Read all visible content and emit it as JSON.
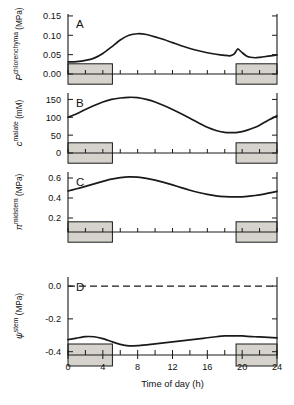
{
  "figure": {
    "x_axis": {
      "title": "Time of day  (h)",
      "ticks": [
        0,
        4,
        8,
        12,
        16,
        20,
        24
      ],
      "tick_labels": [
        "0",
        "4",
        "8",
        "12",
        "16",
        "20",
        "24"
      ],
      "range": [
        0,
        24
      ],
      "minor_tick_interval": 2
    },
    "night_bars": [
      {
        "start": 0,
        "end": 5.1
      },
      {
        "start": 19.3,
        "end": 24
      }
    ],
    "panels": [
      {
        "letter": "A",
        "ylabel_symbol": "P",
        "ylabel_superscript": "chlorenchyma",
        "ylabel_unit": "(MPa)",
        "ylabel_italic": true,
        "ticks": [
          0.0,
          0.05,
          0.1,
          0.15
        ],
        "tick_labels": [
          "0.00",
          "0.05",
          "0.10",
          "0.15"
        ],
        "ylim": [
          0.0,
          0.155
        ]
      },
      {
        "letter": "B",
        "ylabel_symbol": "c",
        "ylabel_superscript": "malate",
        "ylabel_unit": "(mM)",
        "ylabel_italic": true,
        "ticks": [
          0,
          50,
          100,
          150
        ],
        "tick_labels": [
          "0",
          "50",
          "100",
          "150"
        ],
        "ylim": [
          0,
          168
        ]
      },
      {
        "letter": "C",
        "ylabel_symbol": "π",
        "ylabel_superscript": "midstem",
        "ylabel_unit": "(MPa)",
        "ylabel_italic": true,
        "ticks": [
          0.2,
          0.4,
          0.6
        ],
        "tick_labels": [
          "0.2",
          "0.4",
          "0.6"
        ],
        "ylim": [
          0.06,
          0.66
        ]
      },
      {
        "letter": "D",
        "ylabel_symbol": "ψ",
        "ylabel_superscript": "stem",
        "ylabel_unit": "(MPa)",
        "ylabel_italic": true,
        "ticks": [
          0.0,
          -0.2,
          -0.4
        ],
        "tick_labels": [
          "0.0",
          "-0.2",
          "-0.4"
        ],
        "ylim": [
          -0.42,
          0.055
        ],
        "reference_line": 0.0
      }
    ]
  },
  "chart_data": {
    "type": "line",
    "title": "",
    "xlabel": "Time of day  (h)",
    "x": [
      0,
      1,
      2,
      3,
      4,
      5,
      6,
      7,
      8,
      9,
      10,
      11,
      12,
      13,
      14,
      15,
      16,
      17,
      18,
      18.6,
      19.1,
      19.5,
      20,
      20.6,
      21.5,
      22,
      23,
      24
    ],
    "series": [
      {
        "name": "P chlorenchyma (MPa)",
        "panel": "A",
        "ylabel": "P^chlorenchyma (MPa)",
        "ylim": [
          0.0,
          0.155
        ],
        "values": [
          0.031,
          0.032,
          0.035,
          0.041,
          0.053,
          0.07,
          0.088,
          0.1,
          0.104,
          0.102,
          0.096,
          0.089,
          0.081,
          0.073,
          0.066,
          0.06,
          0.055,
          0.051,
          0.048,
          0.047,
          0.052,
          0.065,
          0.055,
          0.045,
          0.042,
          0.043,
          0.046,
          0.049
        ]
      },
      {
        "name": "c malate (mM)",
        "panel": "B",
        "ylabel": "c^malate (mM)",
        "ylim": [
          0,
          168
        ],
        "values": [
          100,
          110,
          122,
          133,
          143,
          150,
          154,
          156,
          155,
          150,
          143,
          133,
          122,
          110,
          97,
          84,
          72,
          63,
          58,
          57,
          57,
          58,
          60,
          64,
          72,
          78,
          92,
          104
        ]
      },
      {
        "name": "pi midstem (MPa)",
        "panel": "C",
        "ylabel": "π^midstem (MPa)",
        "ylim": [
          0.06,
          0.66
        ],
        "values": [
          0.47,
          0.492,
          0.516,
          0.541,
          0.566,
          0.588,
          0.603,
          0.611,
          0.608,
          0.596,
          0.578,
          0.556,
          0.531,
          0.504,
          0.478,
          0.455,
          0.436,
          0.422,
          0.414,
          0.412,
          0.411,
          0.411,
          0.412,
          0.416,
          0.425,
          0.431,
          0.448,
          0.466
        ]
      },
      {
        "name": "psi stem (MPa)",
        "panel": "D",
        "ylabel": "ψ^stem (MPa)",
        "ylim": [
          -0.42,
          0.055
        ],
        "values": [
          -0.326,
          -0.317,
          -0.308,
          -0.309,
          -0.32,
          -0.338,
          -0.355,
          -0.364,
          -0.363,
          -0.358,
          -0.352,
          -0.346,
          -0.34,
          -0.334,
          -0.328,
          -0.322,
          -0.315,
          -0.309,
          -0.304,
          -0.303,
          -0.303,
          -0.303,
          -0.304,
          -0.306,
          -0.309,
          -0.31,
          -0.313,
          -0.316
        ]
      }
    ],
    "shaded_regions": [
      {
        "label": "night",
        "start": 0,
        "end": 5.1
      },
      {
        "label": "night",
        "start": 19.3,
        "end": 24
      }
    ],
    "grid": false,
    "legend": "none"
  }
}
